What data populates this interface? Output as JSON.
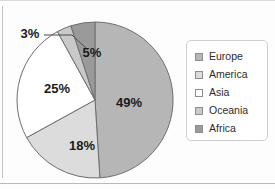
{
  "chart_data": {
    "type": "pie",
    "title": "",
    "subtitle": "",
    "xlabel": "",
    "ylabel": "",
    "grid": false,
    "legend_position": "right",
    "start_angle_deg": 90,
    "direction": "clockwise",
    "categories": [
      "Europe",
      "America",
      "Asia",
      "Oceania",
      "Africa"
    ],
    "values": [
      49,
      18,
      25,
      3,
      5
    ],
    "unit": "%",
    "data_labels": [
      "49%",
      "18%",
      "25%",
      "3%",
      "5%"
    ],
    "colors": [
      "#b6b6b6",
      "#dcdcdc",
      "#ffffff",
      "#c9c9c9",
      "#9a9a9a"
    ],
    "slices": [
      {
        "label": "Europe",
        "value": 49,
        "data_label": "49%",
        "color": "#b6b6b6",
        "label_placement": "inside"
      },
      {
        "label": "America",
        "value": 18,
        "data_label": "18%",
        "color": "#dcdcdc",
        "label_placement": "inside"
      },
      {
        "label": "Asia",
        "value": 25,
        "data_label": "25%",
        "color": "#ffffff",
        "label_placement": "inside"
      },
      {
        "label": "Oceania",
        "value": 3,
        "data_label": "3%",
        "color": "#c9c9c9",
        "label_placement": "outside-callout"
      },
      {
        "label": "Africa",
        "value": 5,
        "data_label": "5%",
        "color": "#9a9a9a",
        "label_placement": "inside"
      }
    ]
  },
  "legend": {
    "items": [
      {
        "label": "Europe",
        "color": "#b6b6b6"
      },
      {
        "label": "America",
        "color": "#dcdcdc"
      },
      {
        "label": "Asia",
        "color": "#ffffff"
      },
      {
        "label": "Oceania",
        "color": "#c9c9c9"
      },
      {
        "label": "Africa",
        "color": "#9a9a9a"
      }
    ]
  },
  "style": {
    "slice_outline": "#6e6e6e",
    "label_color": "#1a1a1a",
    "legend_border": "#cfcfcf",
    "background": "#fdfdfd"
  }
}
